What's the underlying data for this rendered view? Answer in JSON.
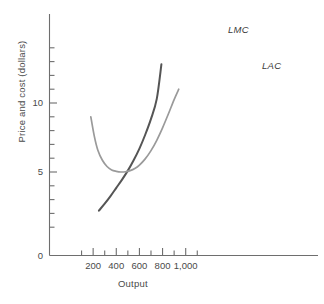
{
  "chart_data": {
    "type": "line",
    "title": "",
    "xlabel": "Output",
    "ylabel": "Price and cost (dollars)",
    "xlim": [
      0,
      1100
    ],
    "ylim": [
      0,
      14
    ],
    "grid": false,
    "legend": "inline-curve-labels",
    "xticks": [
      0,
      100,
      200,
      300,
      400,
      500,
      600,
      700,
      800,
      900,
      1000,
      1100
    ],
    "xtick_labels": [
      "0",
      "",
      "200",
      "",
      "400",
      "",
      "600",
      "",
      "800",
      "",
      "1,000",
      ""
    ],
    "yticks": [
      0,
      1,
      2,
      3,
      4,
      5,
      6,
      7,
      8,
      9,
      10,
      11,
      12,
      13,
      14
    ],
    "ytick_labels": [
      "0",
      "",
      "",
      "",
      "",
      "5",
      "",
      "",
      "",
      "",
      "10",
      "",
      "",
      "",
      ""
    ],
    "series": [
      {
        "name": "LMC",
        "label": "LMC",
        "color": "#555555",
        "points": [
          [
            250,
            2.2
          ],
          [
            300,
            2.7
          ],
          [
            350,
            3.25
          ],
          [
            400,
            3.85
          ],
          [
            450,
            4.45
          ],
          [
            500,
            5.1
          ],
          [
            550,
            5.85
          ],
          [
            600,
            6.7
          ],
          [
            650,
            7.7
          ],
          [
            700,
            8.85
          ],
          [
            750,
            10.3
          ],
          [
            790,
            12.8
          ]
        ]
      },
      {
        "name": "LAC",
        "label": "LAC",
        "color": "#9a9a9a",
        "points": [
          [
            180,
            9.0
          ],
          [
            210,
            7.6
          ],
          [
            240,
            6.6
          ],
          [
            280,
            5.85
          ],
          [
            320,
            5.4
          ],
          [
            360,
            5.15
          ],
          [
            400,
            5.05
          ],
          [
            440,
            5.0
          ],
          [
            480,
            5.02
          ],
          [
            520,
            5.1
          ],
          [
            560,
            5.25
          ],
          [
            600,
            5.5
          ],
          [
            650,
            5.95
          ],
          [
            700,
            6.55
          ],
          [
            750,
            7.3
          ],
          [
            800,
            8.2
          ],
          [
            850,
            9.2
          ],
          [
            900,
            10.25
          ],
          [
            940,
            11.0
          ]
        ]
      }
    ],
    "annotations": [
      {
        "text": "LMC",
        "x": 800,
        "y": 13.6
      },
      {
        "text": "LAC",
        "x": 960,
        "y": 11.9
      }
    ]
  },
  "axes": {
    "x_title": "Output",
    "y_title": "Price and cost (dollars)",
    "origin_label": "0",
    "x_labels": [
      "200",
      "400",
      "600",
      "800",
      "1,000"
    ],
    "y_labels": [
      "5",
      "10"
    ]
  },
  "curves": {
    "lmc_label": "LMC",
    "lac_label": "LAC"
  },
  "colors": {
    "lmc": "#555555",
    "lac": "#9a9a9a",
    "axis": "#6e6e6e",
    "text": "#3a3a3a"
  }
}
